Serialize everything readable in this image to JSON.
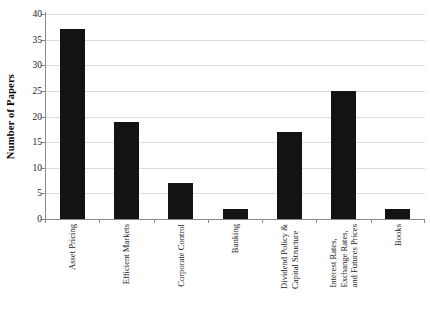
{
  "chart_data": {
    "type": "bar",
    "title": "",
    "xlabel": "",
    "ylabel": "Number of Papers",
    "ylim": [
      0,
      40
    ],
    "ytick_step": 5,
    "yticks": [
      0,
      5,
      10,
      15,
      20,
      25,
      30,
      35,
      40
    ],
    "grid": true,
    "legend": "none",
    "bar_color": "#131313",
    "grid_color": "#dcdcdc",
    "axis_color": "#8a8a8a",
    "categories": [
      "Asset Pricing",
      "Efficient Markets",
      "Corporate Control",
      "Banking",
      "Dividend Policy & Capital Structure",
      "Interest Rates, Exchange Rates, and Futures Prices",
      "Books"
    ],
    "category_label_lines": [
      [
        "Asset Pricing"
      ],
      [
        "Efficient Markets"
      ],
      [
        "Corporate Control"
      ],
      [
        "Banking"
      ],
      [
        "Dividend Policy &",
        "Capital Structure"
      ],
      [
        "Interest Rates,",
        "Exchange Rates,",
        "and Futures Prices"
      ],
      [
        "Books"
      ]
    ],
    "values": [
      37,
      19,
      7,
      2,
      17,
      25,
      2
    ]
  }
}
